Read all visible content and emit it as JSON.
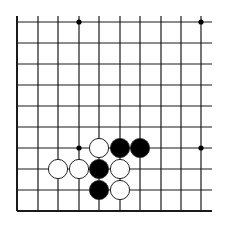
{
  "diagram": {
    "type": "go-board-corner",
    "view": "lower-left corner section",
    "grid": {
      "columns": 10,
      "rows": 10,
      "x_positions": [
        17,
        38,
        58,
        79,
        99,
        120,
        140,
        161,
        181,
        201
      ],
      "y_positions": [
        22,
        43,
        64,
        85,
        106,
        127,
        148,
        169,
        190,
        211
      ],
      "line_extend_top": 16,
      "line_extend_right": 212,
      "edges": [
        "left",
        "bottom"
      ],
      "line_color": "#1a1a1a"
    },
    "star_points": [
      {
        "col": 3,
        "row": 0
      },
      {
        "col": 9,
        "row": 0
      },
      {
        "col": 3,
        "row": 6
      },
      {
        "col": 9,
        "row": 6
      }
    ],
    "stones": [
      {
        "color": "white",
        "col": 4,
        "row": 6
      },
      {
        "color": "black",
        "col": 5,
        "row": 6
      },
      {
        "color": "black",
        "col": 6,
        "row": 6
      },
      {
        "color": "white",
        "col": 2,
        "row": 7
      },
      {
        "color": "white",
        "col": 3,
        "row": 7
      },
      {
        "color": "black",
        "col": 4,
        "row": 7
      },
      {
        "color": "white",
        "col": 5,
        "row": 7
      },
      {
        "color": "black",
        "col": 4,
        "row": 8
      },
      {
        "color": "white",
        "col": 5,
        "row": 8
      }
    ],
    "colors": {
      "black_stone": "#000000",
      "white_stone": "#ffffff",
      "stone_outline": "#222222",
      "background": "#ffffff"
    }
  }
}
